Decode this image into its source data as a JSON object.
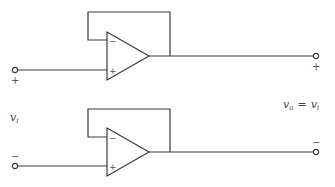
{
  "figure": {
    "stroke_color": "#3a3a3a",
    "background": "#ffffff"
  },
  "labels": {
    "input_voltage": "v",
    "input_voltage_sub": "i",
    "output_voltage": "v",
    "output_voltage_sub": "o",
    "output_eq_sign": "=",
    "output_eq_rhs": "v",
    "output_eq_rhs_sub": "i"
  },
  "top_amp": {
    "inverting_pin_sign": "−",
    "noninverting_pin_sign": "+",
    "input_terminal_sign": "+",
    "output_terminal_sign": "+"
  },
  "bottom_amp": {
    "inverting_pin_sign": "−",
    "noninverting_pin_sign": "+",
    "input_terminal_sign": "−",
    "output_terminal_sign": "−"
  }
}
